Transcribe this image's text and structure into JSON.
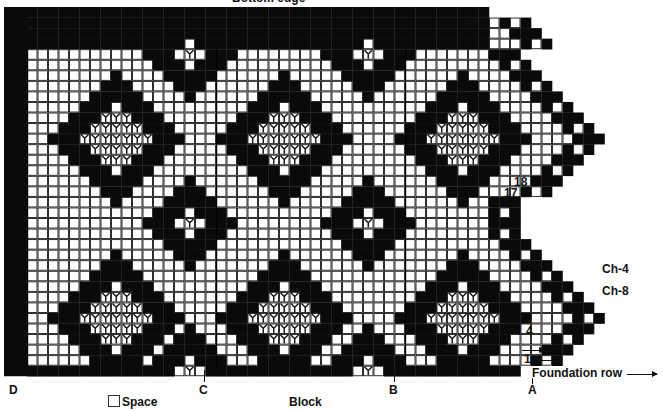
{
  "header": {
    "title": "Bottom edge"
  },
  "grid": {
    "origin_x": 27,
    "origin_y": 7,
    "cell_w": 10.5,
    "cell_h": 10.55,
    "main_cols": 47,
    "rows": 35,
    "colors": {
      "block": "#0a0a0a",
      "space": "#ffffff",
      "line": "#1a1a1a"
    }
  },
  "row_labels": [
    {
      "text": "33",
      "x": 462,
      "y": 16
    },
    {
      "text": "18",
      "x": 516,
      "y": 176
    },
    {
      "text": "17",
      "x": 506,
      "y": 188
    },
    {
      "text": "4",
      "x": 526,
      "y": 325
    },
    {
      "text": "1",
      "x": 524,
      "y": 354
    }
  ],
  "side_labels": [
    {
      "text": "Ch-4",
      "x": 602,
      "y": 262
    },
    {
      "text": "Ch-8",
      "x": 602,
      "y": 285
    }
  ],
  "foundation": {
    "text": "Foundation row",
    "x": 532,
    "y": 368
  },
  "section_labels": [
    {
      "text": "D",
      "x": 9,
      "y": 384
    },
    {
      "text": "C",
      "x": 199,
      "y": 384
    },
    {
      "text": "B",
      "x": 389,
      "y": 384
    },
    {
      "text": "A",
      "x": 528,
      "y": 384
    }
  ],
  "legend": {
    "space": "Space",
    "block": "Block"
  }
}
